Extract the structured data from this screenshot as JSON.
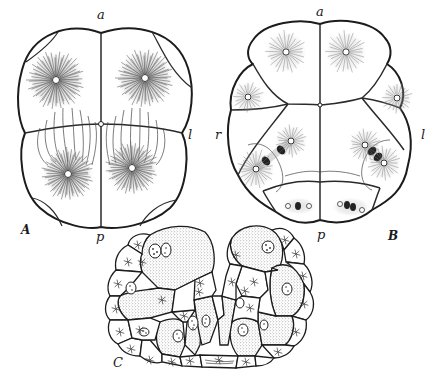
{
  "figure": {
    "panels": [
      {
        "id": "A",
        "label": "A",
        "axis_labels": {
          "top": "a",
          "bottom": "p",
          "right": "l"
        },
        "cell_count": 4,
        "asters": 4
      },
      {
        "id": "B",
        "label": "B",
        "axis_labels": {
          "top": "a",
          "bottom": "p",
          "left": "r",
          "right": "l"
        },
        "cell_count": 8,
        "asters": 8,
        "spindles": 4
      },
      {
        "id": "C",
        "label": "C",
        "structure": "cross-section of embryo with ectoderm ring and yolk-rich endoderm cells"
      }
    ]
  },
  "labels": {
    "A_top": "a",
    "A_bottom": "p",
    "A_right": "l",
    "A_panel": "A",
    "B_top": "a",
    "B_bottom": "p",
    "B_left": "r",
    "B_right": "l",
    "B_panel": "B",
    "C_panel": "C"
  },
  "colors": {
    "ink": "#1c1c1c",
    "paper": "#ffffff",
    "stipple": "#555555"
  }
}
